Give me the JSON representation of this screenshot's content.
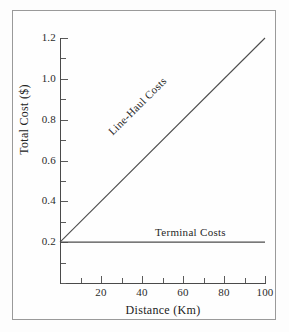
{
  "figure": {
    "background_color": "#fdfdfd",
    "frame_color": "#9a9a9a",
    "axis_color": "#4a4a4a",
    "series_color": "#4d4d4d"
  },
  "chart_data": {
    "type": "line",
    "title": "",
    "xlabel": "Distance (Km)",
    "ylabel": "Total Cost ($)",
    "xlim": [
      0,
      100
    ],
    "ylim": [
      0.0,
      1.2
    ],
    "grid": false,
    "legend_position": "inline-annotation",
    "xticks": [
      0,
      10,
      20,
      30,
      40,
      50,
      60,
      70,
      80,
      90,
      100
    ],
    "xtick_labels": [
      "",
      "",
      "20",
      "",
      "40",
      "",
      "60",
      "",
      "80",
      "",
      "100"
    ],
    "yticks": [
      0.0,
      0.1,
      0.2,
      0.3,
      0.4,
      0.5,
      0.6,
      0.7,
      0.8,
      0.9,
      1.0,
      1.1,
      1.2
    ],
    "ytick_labels": [
      "",
      "",
      "0.2",
      "",
      "0.4",
      "",
      "0.6",
      "",
      "0.8",
      "",
      "1.0",
      "",
      "1.2"
    ],
    "x": [
      0,
      100
    ],
    "series": [
      {
        "name": "Line-Haul Costs",
        "values": [
          0.2,
          1.2
        ],
        "annotation": "Line-Haul Costs"
      },
      {
        "name": "Terminal Costs",
        "values": [
          0.2,
          0.2
        ],
        "annotation": "Terminal Costs"
      }
    ]
  },
  "annotations": {
    "line_haul": "Line-Haul Costs",
    "terminal": "Terminal Costs"
  }
}
